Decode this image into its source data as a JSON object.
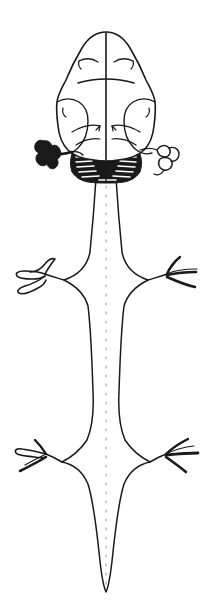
{
  "figure": {
    "title": "Dorsal view of brain and spinal cord",
    "caption": "",
    "background_color": "#ffffff",
    "ink_color": "#1a1a1a",
    "faint_color": "#9a9a9a",
    "width": 212,
    "height": 614
  },
  "parts": {
    "cerebrum": {
      "name": "cerebral hemispheres",
      "label": ""
    },
    "longitudinal_fissure": {
      "name": "longitudinal fissure",
      "label": ""
    },
    "transverse_sulcus": {
      "name": "transverse sulcus",
      "label": ""
    },
    "optic_lobe_left": {
      "name": "left lateral lobe",
      "label": ""
    },
    "optic_lobe_right": {
      "name": "right lateral lobe",
      "label": ""
    },
    "cerebellum": {
      "name": "cerebellum hatched region",
      "label": ""
    },
    "appendage_left": {
      "name": "left filled appendage",
      "label": ""
    },
    "appendage_right": {
      "name": "right outlined appendage",
      "label": ""
    },
    "spinal_cord": {
      "name": "spinal cord",
      "label": ""
    },
    "posterior_median_sulcus": {
      "name": "posterior median sulcus",
      "label": ""
    },
    "cervical_enlargement": {
      "name": "cervical enlargement",
      "label": ""
    },
    "lumbar_enlargement": {
      "name": "lumbar enlargement",
      "label": ""
    },
    "conus_medullaris": {
      "name": "conus medullaris",
      "label": ""
    },
    "nerve_roots_cervical_left": {
      "name": "left brachial plexus roots",
      "label": ""
    },
    "nerve_roots_cervical_right": {
      "name": "right brachial plexus roots",
      "label": ""
    },
    "nerve_roots_lumbar_left": {
      "name": "left lumbosacral plexus roots",
      "label": ""
    },
    "nerve_roots_lumbar_right": {
      "name": "right lumbosacral plexus roots",
      "label": ""
    }
  }
}
